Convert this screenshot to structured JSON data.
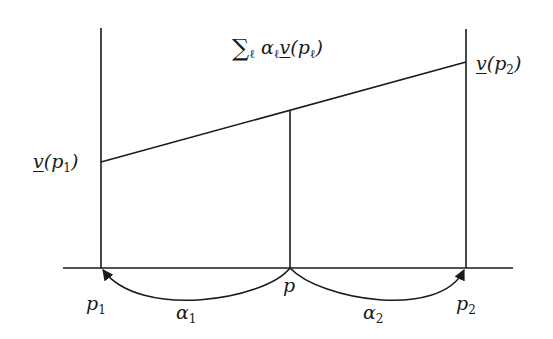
{
  "diagram": {
    "title_formula": {
      "sigma": "∑",
      "sub": "ℓ",
      "alpha": "α",
      "alpha_sub": "ℓ",
      "v": "v",
      "arg_open": "(p",
      "arg_sub": "ℓ",
      "arg_close": ")"
    },
    "labels": {
      "v_p1": {
        "v": "v",
        "open": "(p",
        "sub": "1",
        "close": ")"
      },
      "v_p2": {
        "v": "v",
        "open": "(p",
        "sub": "2",
        "close": ")"
      },
      "p1": {
        "base": "p",
        "sub": "1"
      },
      "p": {
        "base": "p"
      },
      "p2": {
        "base": "p",
        "sub": "2"
      },
      "alpha1": {
        "base": "α",
        "sub": "1"
      },
      "alpha2": {
        "base": "α",
        "sub": "2"
      }
    },
    "colors": {
      "stroke": "#1a1a1a",
      "background": "#ffffff"
    }
  }
}
